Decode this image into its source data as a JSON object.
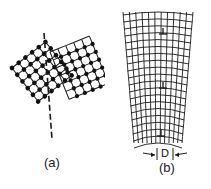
{
  "figure": {
    "panels": [
      {
        "id": "a",
        "caption": "(a)",
        "description": "Two tilted crystal lattices meeting at a low-angle grain boundary (dashed line)"
      },
      {
        "id": "b",
        "caption": "(b)",
        "description": "Bent lattice with edge dislocations forming a tilt boundary",
        "spacing_label": "D",
        "dislocation_symbol": "⊥"
      }
    ],
    "colors": {
      "line": "#1a1a1a",
      "atom": "#111111",
      "background": "#ffffff"
    }
  }
}
